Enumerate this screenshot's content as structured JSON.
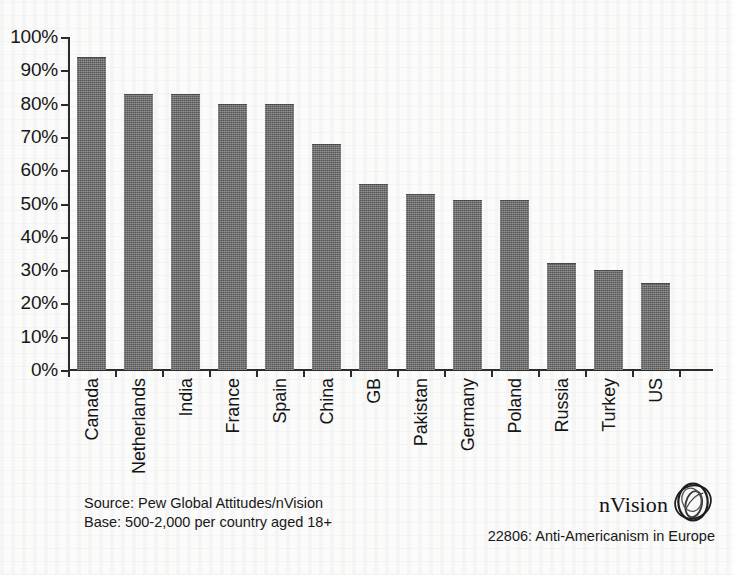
{
  "chart_data": {
    "type": "bar",
    "title": "",
    "subtitle": "",
    "xlabel": "",
    "ylabel": "",
    "ylim": [
      0,
      100
    ],
    "grid": false,
    "legend": "none",
    "categories": [
      "Canada",
      "Netherlands",
      "India",
      "France",
      "Spain",
      "China",
      "GB",
      "Pakistan",
      "Germany",
      "Poland",
      "Russia",
      "Turkey",
      "US"
    ],
    "values": [
      94,
      83,
      83,
      80,
      80,
      68,
      56,
      53,
      51,
      51,
      32,
      30,
      26
    ],
    "value_suffix": "%",
    "y_ticks": [
      0,
      10,
      20,
      30,
      40,
      50,
      60,
      70,
      80,
      90,
      100
    ],
    "y_tick_labels": [
      "0%",
      "10%",
      "20%",
      "30%",
      "40%",
      "50%",
      "60%",
      "70%",
      "80%",
      "90%",
      "100%"
    ],
    "bar_color": "#6a6a6a",
    "axis_color": "#2b2b2b",
    "background_color": "#fbfbfa"
  },
  "footer": {
    "source_line": "Source: Pew Global Attitudes/nVision",
    "base_line": "Base: 500-2,000 per country aged 18+"
  },
  "brand": {
    "name": "nVision",
    "logo_icon": "nvision-sphere-logo-icon",
    "caption": "22806: Anti-Americanism in Europe"
  }
}
